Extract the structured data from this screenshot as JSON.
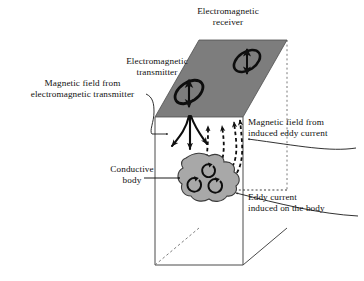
{
  "figure": {
    "type": "diagram",
    "background_color": "#ffffff",
    "stroke_color": "#1a1a1a",
    "plane_fill": "#7d7d7d",
    "body_fill": "#a8a8a8"
  },
  "labels": {
    "receiver": "Electromagnetic\nreceiver",
    "transmitter": "Electromagnetic\ntransmitter",
    "magnetic_field_transmitter": "Magnetic field from\nelectromagnetic transmitter",
    "magnetic_field_eddy": "Magnetic field from\ninduced eddy current",
    "conductive_body": "Conductive\nbody",
    "eddy_current_body": "Eddy current\ninduced on the body"
  },
  "elements": {
    "ground_plane": "gray parallelogram representing the ground surface",
    "soil_block": "wireframe rectangular prism representing the subsurface",
    "transmitter_coil": "tilted ellipse coil with vertical double arrow",
    "receiver_coil": "tilted ellipse coil with vertical double arrow",
    "primary_field_arrows": "solid black arrows fanning downward from transmitter",
    "secondary_field_arrows": "dashed black arrows rising from the body to the receiver",
    "eddy_loops": "three circular arrow loops drawn inside the conductive body"
  }
}
